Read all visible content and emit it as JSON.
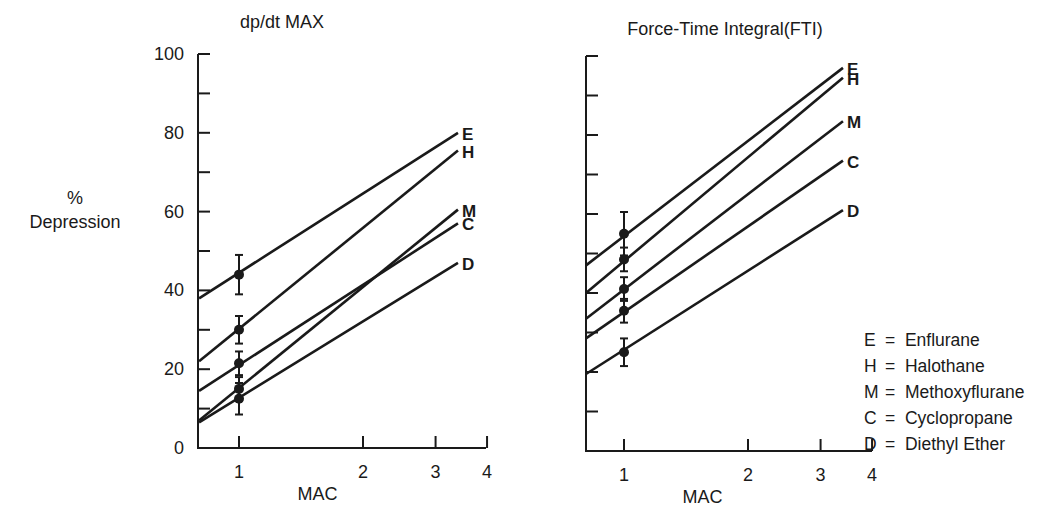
{
  "y_axis_label": {
    "line1": "%",
    "line2": "Depression"
  },
  "legend": [
    {
      "key": "E",
      "eq": "=",
      "name": "Enflurane"
    },
    {
      "key": "H",
      "eq": "=",
      "name": "Halothane"
    },
    {
      "key": "M",
      "eq": "=",
      "name": "Methoxyflurane"
    },
    {
      "key": "C",
      "eq": "=",
      "name": "Cyclopropane"
    },
    {
      "key": "D",
      "eq": "=",
      "name": "Diethyl Ether"
    }
  ],
  "chart_data": [
    {
      "type": "line",
      "title": "dp/dt MAX",
      "xlabel": "MAC",
      "ylabel": "% Depression",
      "xscale": "log",
      "xlim": [
        0.8,
        4
      ],
      "ylim": [
        0,
        100
      ],
      "x_ticks": [
        1,
        2,
        3,
        4
      ],
      "x_tick_labels": [
        "1",
        "2",
        "3",
        "4"
      ],
      "y_ticks": [
        0,
        20,
        40,
        60,
        80,
        100
      ],
      "y_tick_labels": [
        "0",
        "20",
        "40",
        "60",
        "80",
        "100"
      ],
      "y_minor_ticks": [
        10,
        30,
        50,
        70,
        90
      ],
      "grid": false,
      "series": [
        {
          "name": "E",
          "label": "Enflurane",
          "line": {
            "x": [
              0.8,
              3.4
            ],
            "y": [
              38,
              80
            ]
          },
          "point": {
            "x": 1,
            "y": 44,
            "err": 5
          }
        },
        {
          "name": "H",
          "label": "Halothane",
          "line": {
            "x": [
              0.8,
              3.4
            ],
            "y": [
              22,
              75.5
            ]
          },
          "point": {
            "x": 1,
            "y": 30,
            "err": 3.5
          }
        },
        {
          "name": "M",
          "label": "Methoxyflurane",
          "line": {
            "x": [
              0.8,
              3.4
            ],
            "y": [
              7,
              60.5
            ]
          },
          "point": {
            "x": 1,
            "y": 15,
            "err": 3
          }
        },
        {
          "name": "C",
          "label": "Cyclopropane",
          "line": {
            "x": [
              0.8,
              3.4
            ],
            "y": [
              14.5,
              57
            ]
          },
          "point": {
            "x": 1,
            "y": 21.5,
            "err": 3
          }
        },
        {
          "name": "D",
          "label": "Diethyl Ether",
          "line": {
            "x": [
              0.8,
              3.4
            ],
            "y": [
              6.5,
              47
            ]
          },
          "point": {
            "x": 1,
            "y": 12.5,
            "err": 4
          }
        }
      ]
    },
    {
      "type": "line",
      "title": "Force-Time Integral(FTI)",
      "xlabel": "MAC",
      "ylabel": "% Depression",
      "xscale": "log",
      "xlim": [
        0.8,
        4
      ],
      "ylim": [
        0,
        100
      ],
      "x_ticks": [
        1,
        2,
        3,
        4
      ],
      "x_tick_labels": [
        "1",
        "2",
        "3",
        "4"
      ],
      "y_ticks": [
        10,
        20,
        30,
        40,
        50,
        60,
        70,
        80,
        90,
        100
      ],
      "y_tick_labels": [],
      "grid": false,
      "series": [
        {
          "name": "E",
          "label": "Enflurane",
          "line": {
            "x": [
              0.8,
              3.4
            ],
            "y": [
              47,
              97
            ]
          },
          "point": {
            "x": 1,
            "y": 55,
            "err": 5.5
          }
        },
        {
          "name": "H",
          "label": "Halothane",
          "line": {
            "x": [
              0.8,
              3.4
            ],
            "y": [
              40,
              94.5
            ]
          },
          "point": {
            "x": 1,
            "y": 48.5,
            "err": 3
          }
        },
        {
          "name": "M",
          "label": "Methoxyflurane",
          "line": {
            "x": [
              0.8,
              3.4
            ],
            "y": [
              33.5,
              83.5
            ]
          },
          "point": {
            "x": 1,
            "y": 41,
            "err": 3
          }
        },
        {
          "name": "C",
          "label": "Cyclopropane",
          "line": {
            "x": [
              0.8,
              3.4
            ],
            "y": [
              28.5,
              73.5
            ]
          },
          "point": {
            "x": 1,
            "y": 35.5,
            "err": 3
          }
        },
        {
          "name": "D",
          "label": "Diethyl Ether",
          "line": {
            "x": [
              0.8,
              3.4
            ],
            "y": [
              19.5,
              61
            ]
          },
          "point": {
            "x": 1,
            "y": 25,
            "err": 3.5
          }
        }
      ]
    }
  ]
}
